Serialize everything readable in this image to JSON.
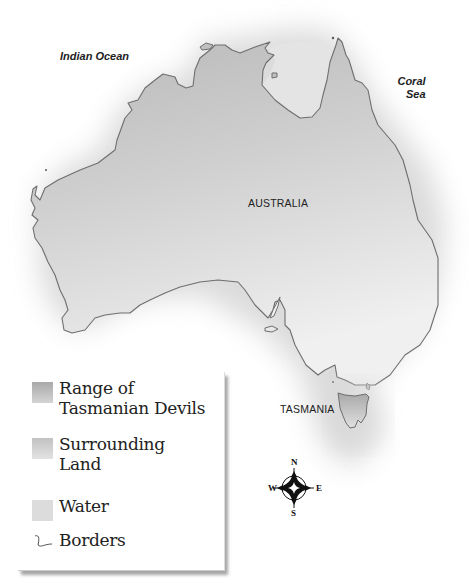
{
  "map": {
    "labels": {
      "indian_ocean": "Indian Ocean",
      "coral_sea_line1": "Coral",
      "coral_sea_line2": "Sea",
      "australia": "AUSTRALIA",
      "tasmania": "TASMANIA"
    },
    "colors": {
      "range_of_tasmanian_devils": "#bcbcbc",
      "surrounding_land": "#d4d4d4",
      "water": "#e6e6e6",
      "border_stroke": "#6e6e6e",
      "background": "#ffffff"
    }
  },
  "legend": {
    "items": [
      {
        "label_line1": "Range of",
        "label_line2": "Tasmanian Devils",
        "swatch": "#b5b5b5"
      },
      {
        "label_line1": "Surrounding",
        "label_line2": "Land",
        "swatch": "#cdcdcd"
      },
      {
        "label_line1": "Water",
        "label_line2": "",
        "swatch": "#dedede"
      },
      {
        "label_line1": "Borders",
        "label_line2": "",
        "swatch": "line"
      }
    ]
  },
  "compass": {
    "north": "N",
    "south": "S",
    "east": "E",
    "west": "W"
  }
}
